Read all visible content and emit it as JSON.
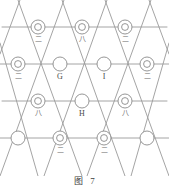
{
  "figure": {
    "caption_label": "图",
    "caption_number": "7",
    "colors": {
      "line": "#9a9a9a",
      "node_stroke": "#8a8a8a",
      "node_fill": "#ffffff",
      "text": "#4a4a4a",
      "background": "#ffffff"
    },
    "lattice": {
      "type": "triangular",
      "row_spacing": 37,
      "col_spacing": 43.5,
      "node_radius": 7,
      "inner_radius": 3.4
    },
    "nodes": [
      {
        "id": "n-r0-c1",
        "x": 38,
        "y": 27,
        "style": "double",
        "label": "二",
        "label_kind": "cjk"
      },
      {
        "id": "n-r0-c2",
        "x": 82,
        "y": 27,
        "style": "double",
        "label": "八",
        "label_kind": "cjk"
      },
      {
        "id": "n-r0-c3",
        "x": 125,
        "y": 27,
        "style": "double",
        "label": "二",
        "label_kind": "cjk"
      },
      {
        "id": "n-r1-c0",
        "x": 18,
        "y": 64,
        "style": "double",
        "label": "二",
        "label_kind": "cjk"
      },
      {
        "id": "n-r1-c1",
        "x": 60,
        "y": 64,
        "style": "plain",
        "label": "G",
        "label_kind": "latin"
      },
      {
        "id": "n-r1-c2",
        "x": 104,
        "y": 64,
        "style": "plain",
        "label": "I",
        "label_kind": "latin"
      },
      {
        "id": "n-r1-c3",
        "x": 147,
        "y": 64,
        "style": "double",
        "label": "二",
        "label_kind": "cjk"
      },
      {
        "id": "n-r2-c1",
        "x": 38,
        "y": 101,
        "style": "double",
        "label": "八",
        "label_kind": "cjk"
      },
      {
        "id": "n-r2-c2",
        "x": 82,
        "y": 101,
        "style": "plain",
        "label": "H",
        "label_kind": "latin"
      },
      {
        "id": "n-r2-c3",
        "x": 125,
        "y": 101,
        "style": "double",
        "label": "八",
        "label_kind": "cjk"
      },
      {
        "id": "n-r3-c0",
        "x": 18,
        "y": 138,
        "style": "plain",
        "label": "",
        "label_kind": "none"
      },
      {
        "id": "n-r3-c1",
        "x": 60,
        "y": 138,
        "style": "double",
        "label": "二",
        "label_kind": "cjk"
      },
      {
        "id": "n-r3-c2",
        "x": 104,
        "y": 138,
        "style": "double",
        "label": "二",
        "label_kind": "cjk"
      },
      {
        "id": "n-r3-c3",
        "x": 147,
        "y": 138,
        "style": "plain",
        "label": "",
        "label_kind": "none"
      }
    ],
    "horizontal_lines": [
      {
        "id": "h-row0",
        "y": 27,
        "x1": 2,
        "x2": 167
      },
      {
        "id": "h-row1",
        "y": 64,
        "x1": 0,
        "x2": 169
      },
      {
        "id": "h-row2",
        "y": 101,
        "x1": 2,
        "x2": 167
      },
      {
        "id": "h-row3",
        "y": 138,
        "x1": 0,
        "x2": 169
      }
    ],
    "diagonal_lines_down_right": [
      {
        "id": "d1-a",
        "x1": 0,
        "y1": 43,
        "x2": 38,
        "y2": 176
      },
      {
        "id": "d1-b",
        "x1": 18,
        "y1": 0,
        "x2": 82,
        "y2": 176
      },
      {
        "id": "d1-c",
        "x1": 62,
        "y1": 0,
        "x2": 125,
        "y2": 176
      },
      {
        "id": "d1-d",
        "x1": 105,
        "y1": 0,
        "x2": 169,
        "y2": 176
      },
      {
        "id": "d1-e",
        "x1": 149,
        "y1": 0,
        "x2": 169,
        "y2": 54
      }
    ],
    "diagonal_lines_down_left": [
      {
        "id": "d2-a",
        "x1": 20,
        "y1": 0,
        "x2": 0,
        "y2": 54
      },
      {
        "id": "d2-b",
        "x1": 64,
        "y1": 0,
        "x2": 0,
        "y2": 176
      },
      {
        "id": "d2-c",
        "x1": 107,
        "y1": 0,
        "x2": 44,
        "y2": 176
      },
      {
        "id": "d2-d",
        "x1": 151,
        "y1": 0,
        "x2": 87,
        "y2": 176
      },
      {
        "id": "d2-e",
        "x1": 169,
        "y1": 43,
        "x2": 131,
        "y2": 176
      }
    ]
  }
}
